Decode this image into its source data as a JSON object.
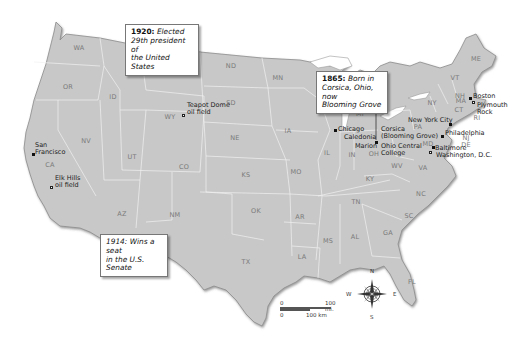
{
  "map": {
    "title": "Warren G. Harding life events map",
    "background_color": "#ffffff",
    "land_color": "#c9c9c9",
    "border_color": "#f2f2f2",
    "coast_color": "#8a8a8a"
  },
  "callouts": [
    {
      "id": "1920",
      "year": "1920:",
      "text": "Elected 29th president of the United States",
      "lines": [
        "Elected",
        "29th president of",
        "the United States"
      ]
    },
    {
      "id": "1865",
      "year": "1865:",
      "text": "Born in Corsica, Ohio, now Blooming Grove",
      "lines": [
        "Born in",
        "Corsica, Ohio, now",
        "Blooming Grove"
      ]
    },
    {
      "id": "1914",
      "year": "1914:",
      "text": "Wins a seat in the U.S. Senate",
      "lines": [
        "Wins a seat",
        "in the U.S. Senate"
      ]
    }
  ],
  "states": [
    "WA",
    "OR",
    "CA",
    "ID",
    "NV",
    "MT",
    "WY",
    "UT",
    "AZ",
    "CO",
    "NM",
    "ND",
    "SD",
    "NE",
    "KS",
    "OK",
    "TX",
    "MN",
    "IA",
    "MO",
    "AR",
    "LA",
    "WI",
    "IL",
    "MI",
    "IN",
    "OH",
    "KY",
    "TN",
    "MS",
    "AL",
    "GA",
    "FL",
    "SC",
    "NC",
    "VA",
    "WV",
    "PA",
    "NY",
    "VT",
    "NH",
    "ME",
    "MA",
    "CT",
    "RI",
    "NJ",
    "DE",
    "MD"
  ],
  "places": {
    "san_francisco": [
      "San",
      "Francisco"
    ],
    "elk_hills": [
      "Elk Hills",
      "oil field"
    ],
    "teapot_dome": [
      "Teapot Dome",
      "oil field"
    ],
    "chicago": "Chicago",
    "caledonia": "Caledonia",
    "marion": "Marion",
    "corsica": [
      "Corsica",
      "(Blooming Grove)"
    ],
    "ohio_central": [
      "Ohio Central",
      "College"
    ],
    "new_york_city": "New York City",
    "philadelphia": "Philadelphia",
    "baltimore": "Baltimore",
    "washington_dc": "Washington, D.C.",
    "boston": "Boston",
    "plymouth_rock": [
      "Plymouth",
      "Rock"
    ]
  },
  "scale_bar": {
    "miles_zero": "0",
    "miles_label": "100 mi.",
    "km_zero": "0",
    "km_label": "100 km"
  },
  "compass": {
    "n": "N",
    "s": "S",
    "e": "E",
    "w": "W"
  }
}
